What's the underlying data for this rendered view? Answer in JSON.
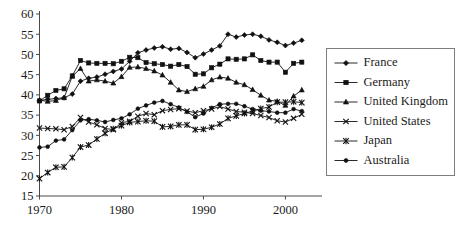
{
  "chart_data": {
    "type": "line",
    "title": "",
    "subtitle": "",
    "xlabel": "",
    "ylabel": "",
    "xlim": [
      1970,
      2003
    ],
    "ylim": [
      15,
      60
    ],
    "yticks": [
      15,
      20,
      25,
      30,
      35,
      40,
      45,
      50,
      55,
      60
    ],
    "xticks": [
      1970,
      1980,
      1990,
      2000
    ],
    "xtick_labels": [
      "1970",
      "1980",
      "1990",
      "2000"
    ],
    "ytick_labels": [
      "15",
      "20",
      "25",
      "30",
      "35",
      "40",
      "45",
      "50",
      "55",
      "60"
    ],
    "grid": false,
    "legend_position": "right-outside",
    "x": [
      1970,
      1971,
      1972,
      1973,
      1974,
      1975,
      1976,
      1977,
      1978,
      1979,
      1980,
      1981,
      1982,
      1983,
      1984,
      1985,
      1986,
      1987,
      1988,
      1989,
      1990,
      1991,
      1992,
      1993,
      1994,
      1995,
      1996,
      1997,
      1998,
      1999,
      2000,
      2001,
      2002
    ],
    "series": [
      {
        "name": "France",
        "marker": "diamond",
        "color": "#111111",
        "values": [
          38.6,
          38.9,
          39.1,
          39.3,
          40.2,
          43.4,
          44.1,
          44.4,
          45.1,
          45.8,
          46.4,
          48.3,
          50.4,
          51.1,
          51.6,
          51.9,
          51.3,
          51.5,
          50.5,
          49.2,
          50.1,
          51.1,
          52.1,
          55.0,
          54.3,
          54.8,
          55.0,
          54.5,
          53.6,
          53.0,
          52.2,
          52.8,
          53.5
        ]
      },
      {
        "name": "Germany",
        "marker": "square",
        "color": "#111111",
        "values": [
          38.5,
          39.9,
          41.1,
          41.5,
          44.7,
          48.5,
          47.9,
          47.8,
          47.8,
          47.7,
          48.3,
          49.3,
          49.2,
          48.0,
          47.7,
          47.5,
          47.1,
          47.5,
          47.0,
          45.1,
          45.2,
          46.7,
          47.6,
          48.9,
          48.8,
          48.9,
          49.9,
          48.5,
          48.1,
          48.1,
          45.6,
          47.8,
          48.1
        ]
      },
      {
        "name": "United Kingdom",
        "marker": "triangle",
        "color": "#111111",
        "values": [
          38.7,
          38.4,
          38.6,
          39.3,
          44.6,
          46.5,
          43.4,
          43.7,
          43.4,
          42.9,
          44.5,
          46.8,
          46.9,
          46.5,
          45.9,
          44.9,
          43.1,
          41.2,
          40.8,
          41.5,
          42.1,
          43.7,
          44.4,
          44.1,
          43.1,
          42.5,
          41.3,
          39.9,
          38.7,
          38.4,
          37.4,
          39.7,
          41.2
        ]
      },
      {
        "name": "United States",
        "marker": "cross",
        "color": "#111111",
        "values": [
          31.8,
          31.7,
          31.6,
          31.4,
          32.2,
          34.4,
          33.3,
          32.6,
          31.7,
          31.4,
          33.1,
          33.5,
          34.7,
          35.4,
          35.1,
          36.1,
          36.4,
          36.6,
          36.0,
          35.6,
          36.1,
          36.5,
          37.1,
          36.5,
          35.9,
          35.7,
          35.4,
          34.9,
          34.4,
          33.6,
          33.3,
          34.2,
          35.2
        ]
      },
      {
        "name": "Japan",
        "marker": "asterisk",
        "color": "#111111",
        "values": [
          19.3,
          20.8,
          22.1,
          22.2,
          24.5,
          27.1,
          27.6,
          29.1,
          30.5,
          31.6,
          32.4,
          33.2,
          33.4,
          33.6,
          33.5,
          32.1,
          32.2,
          32.6,
          32.6,
          31.4,
          31.5,
          32.0,
          32.8,
          34.2,
          34.8,
          35.4,
          36.0,
          36.6,
          37.0,
          38.2,
          38.2,
          38.3,
          38.1
        ]
      },
      {
        "name": "Australia",
        "marker": "dot",
        "color": "#111111",
        "values": [
          27.0,
          27.2,
          28.7,
          29.0,
          31.3,
          33.7,
          34.0,
          33.7,
          33.3,
          33.8,
          34.2,
          35.2,
          36.6,
          37.4,
          38.1,
          38.5,
          37.7,
          36.9,
          35.8,
          34.5,
          35.4,
          36.8,
          37.7,
          37.8,
          37.8,
          37.2,
          36.5,
          36.1,
          35.9,
          35.6,
          35.6,
          36.5,
          36.0
        ]
      }
    ]
  },
  "legend": {
    "items": [
      {
        "label": "France",
        "marker": "diamond"
      },
      {
        "label": "Germany",
        "marker": "square"
      },
      {
        "label": "United Kingdom",
        "marker": "triangle"
      },
      {
        "label": "United States",
        "marker": "cross"
      },
      {
        "label": "Japan",
        "marker": "asterisk"
      },
      {
        "label": "Australia",
        "marker": "dot"
      }
    ]
  }
}
